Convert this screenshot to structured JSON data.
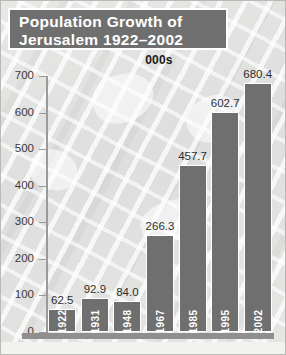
{
  "title": {
    "line1": "Population Growth of",
    "line2": "Jerusalem 1922–2002"
  },
  "subtitle": "000s",
  "colors": {
    "bar": "#6f6f6f",
    "title_box": "#6f6f6f",
    "title_text": "#ffffff",
    "value_label": "#2f2f2f",
    "axis": "#9a9a9a",
    "background": "#e2e2e0"
  },
  "chart_data": {
    "type": "bar",
    "title": "Population Growth of Jerusalem 1922–2002",
    "subtitle": "000s",
    "xlabel": "",
    "ylabel": "000s",
    "ylim": [
      0,
      700
    ],
    "yticks": [
      0,
      100,
      200,
      300,
      400,
      500,
      600,
      700
    ],
    "ytick_labels": [
      "0",
      "100",
      "200",
      "300",
      "400",
      "500",
      "600",
      "700"
    ],
    "grid": false,
    "legend": "none",
    "categories": [
      "1922",
      "1931",
      "1948",
      "1967",
      "1985",
      "1995",
      "2002"
    ],
    "values": [
      62.5,
      92.9,
      84.0,
      266.3,
      457.7,
      602.7,
      680.4
    ],
    "value_labels": [
      "62.5",
      "92.9",
      "84.0",
      "266.3",
      "457.7",
      "602.7",
      "680.4"
    ]
  }
}
